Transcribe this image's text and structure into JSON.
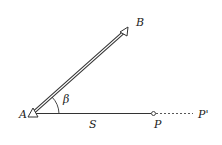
{
  "diagram": {
    "points": {
      "A": {
        "label": "A",
        "x": 33,
        "y": 114
      },
      "B": {
        "label": "B",
        "x": 125,
        "y": 30
      },
      "P": {
        "label": "P",
        "x": 153,
        "y": 113
      },
      "P_prime": {
        "label": "P'",
        "x": 200,
        "y": 113
      }
    },
    "angle_label": "β",
    "distance_label": "S",
    "segments": [
      {
        "from": "A",
        "to": "B",
        "style": "double-line"
      },
      {
        "from": "A",
        "to": "P",
        "style": "solid"
      },
      {
        "from": "P",
        "to": "P'",
        "style": "dashed"
      }
    ],
    "colors": {
      "stroke": "#333333",
      "background": "#ffffff"
    }
  }
}
